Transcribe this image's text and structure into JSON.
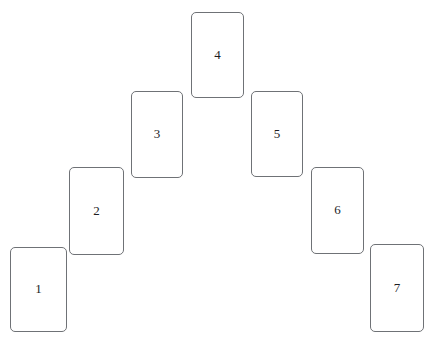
{
  "canvas": {
    "width": 436,
    "height": 345,
    "background_color": "#ffffff",
    "title": "Seven card spread"
  },
  "style": {
    "card_fill": "#ffffff",
    "card_border_color": "#6f7276",
    "card_border_width": 1,
    "card_corner_radius": 5,
    "label_color": "#1d1d1f",
    "label_font_size": 13
  },
  "spread": {
    "card_count": 7,
    "arrangement": "inverted-v arch ascending from lower-left to apex then descending to lower-right",
    "cards": [
      {
        "label": "1",
        "position": 1,
        "x": 10,
        "y": 247,
        "width": 57,
        "height": 85
      },
      {
        "label": "2",
        "position": 2,
        "x": 69,
        "y": 167,
        "width": 55,
        "height": 88
      },
      {
        "label": "3",
        "position": 3,
        "x": 131,
        "y": 91,
        "width": 52,
        "height": 87
      },
      {
        "label": "4",
        "position": 4,
        "x": 191,
        "y": 12,
        "width": 53,
        "height": 86
      },
      {
        "label": "5",
        "position": 5,
        "x": 251,
        "y": 91,
        "width": 52,
        "height": 86
      },
      {
        "label": "6",
        "position": 6,
        "x": 311,
        "y": 167,
        "width": 53,
        "height": 87
      },
      {
        "label": "7",
        "position": 7,
        "x": 370,
        "y": 244,
        "width": 54,
        "height": 88
      }
    ]
  }
}
